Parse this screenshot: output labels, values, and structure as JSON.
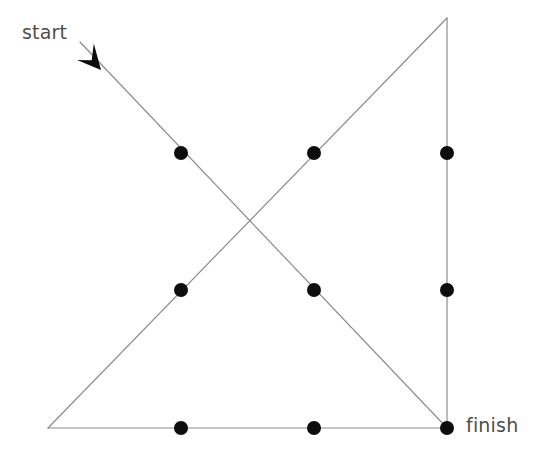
{
  "figure": {
    "background_color": "#ffffff",
    "line_color": "#8c8c8c",
    "line_width": 1.2,
    "node_color": "#0d0d0d",
    "node_radius": 7,
    "text_color": "#4d4d4d",
    "width": 547,
    "height": 457
  },
  "labels": {
    "start": "start",
    "finish": "finish"
  },
  "vertices": {
    "bottom_left": {
      "x": 48,
      "y": 428
    },
    "top_apex": {
      "x": 447,
      "y": 18
    },
    "bottom_right": {
      "x": 447,
      "y": 428
    },
    "start_tail": {
      "x": 80,
      "y": 42
    },
    "crossing": {
      "x": 248,
      "y": 223
    }
  },
  "edges": [
    {
      "name": "bottom-edge",
      "x1": 48,
      "y1": 428,
      "x2": 447,
      "y2": 428
    },
    {
      "name": "right-vertical-edge",
      "x1": 447,
      "y1": 18,
      "x2": 447,
      "y2": 428
    },
    {
      "name": "ascending-hypotenuse",
      "x1": 48,
      "y1": 428,
      "x2": 447,
      "y2": 18
    },
    {
      "name": "descending-diagonal-start-to-finish",
      "x1": 80,
      "y1": 42,
      "x2": 447,
      "y2": 428
    }
  ],
  "arrow": {
    "name": "start-direction-arrowhead",
    "tip": {
      "x": 101,
      "y": 70
    },
    "direction": "down-right",
    "color": "#0d0d0d"
  },
  "nodes": [
    {
      "id": "n1",
      "x": 181,
      "y": 153,
      "on": "descending-diagonal"
    },
    {
      "id": "n2",
      "x": 314,
      "y": 153,
      "on": "ascending-hypotenuse"
    },
    {
      "id": "n3",
      "x": 447,
      "y": 153,
      "on": "right-vertical-edge"
    },
    {
      "id": "n4",
      "x": 181,
      "y": 290,
      "on": "ascending-hypotenuse"
    },
    {
      "id": "n5",
      "x": 314,
      "y": 290,
      "on": "descending-diagonal"
    },
    {
      "id": "n6",
      "x": 447,
      "y": 290,
      "on": "right-vertical-edge"
    },
    {
      "id": "n7",
      "x": 181,
      "y": 428,
      "on": "bottom-edge"
    },
    {
      "id": "n8",
      "x": 314,
      "y": 428,
      "on": "bottom-edge"
    },
    {
      "id": "n9",
      "x": 447,
      "y": 428,
      "on": "bottom-edge-corner-finish"
    }
  ]
}
